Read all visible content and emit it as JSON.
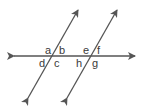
{
  "diagram": {
    "line_color": "#555555",
    "label_color": "#3a3a3a",
    "labels": {
      "a": "a",
      "b": "b",
      "c": "c",
      "d": "d",
      "e": "e",
      "f": "f",
      "g": "g",
      "h": "h"
    }
  }
}
